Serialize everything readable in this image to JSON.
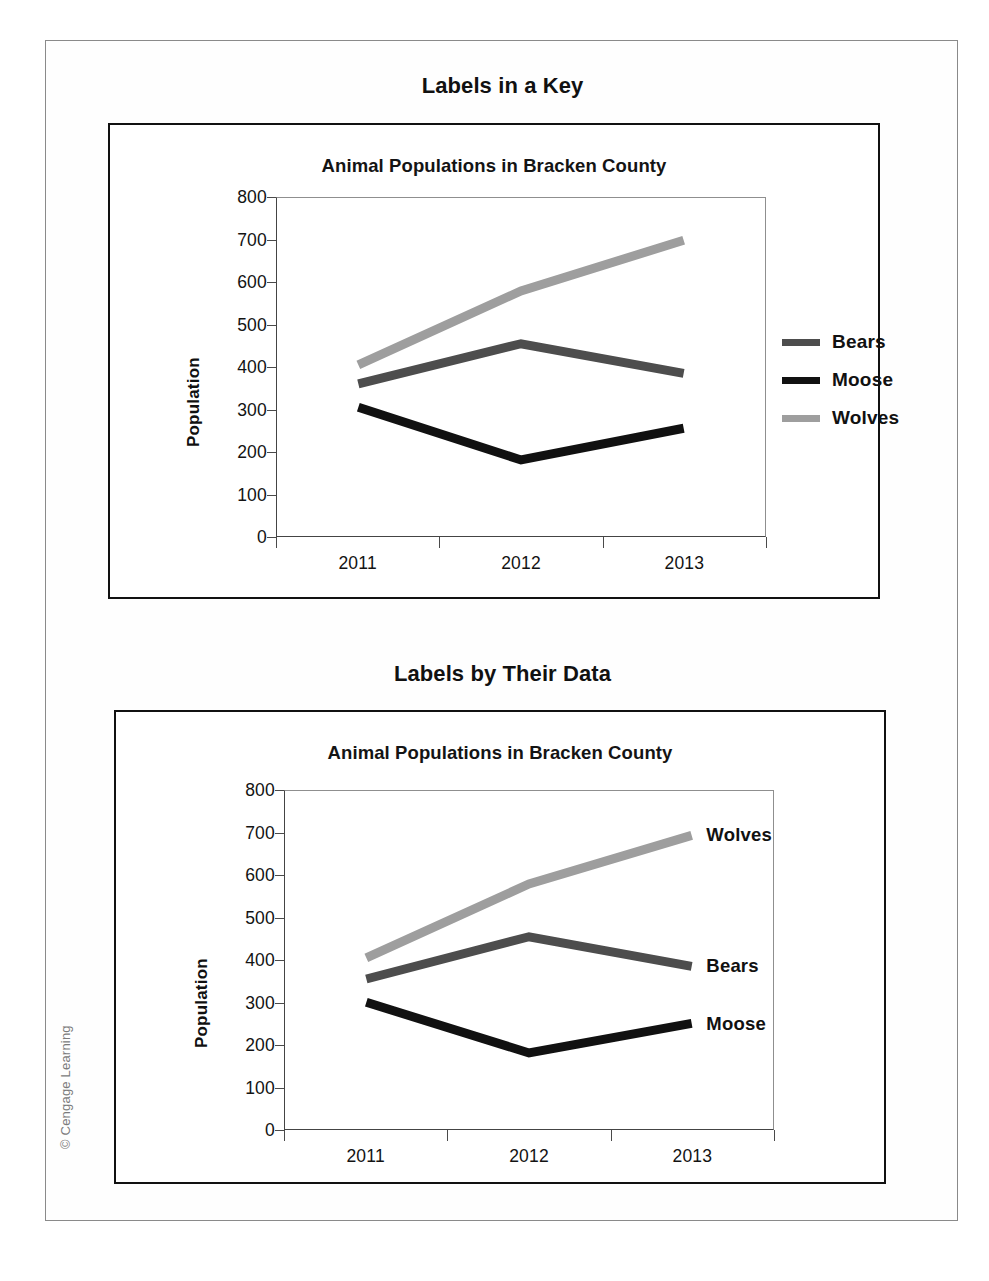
{
  "figure": {
    "copyright": "© Cengage Learning"
  },
  "sections": [
    {
      "heading": "Labels in a Key",
      "chart_title": "Animal Populations in Bracken County",
      "label_style": "key"
    },
    {
      "heading": "Labels by Their Data",
      "chart_title": "Animal Populations in Bracken County",
      "label_style": "inline"
    }
  ],
  "legend": {
    "items": [
      {
        "label": "Bears",
        "color": "#4d4d4d"
      },
      {
        "label": "Moose",
        "color": "#111111"
      },
      {
        "label": "Wolves",
        "color": "#9e9e9e"
      }
    ]
  },
  "chart_data": [
    {
      "type": "line",
      "title": "Animal Populations in Bracken County",
      "subtitle": "Labels in a Key",
      "xlabel": "",
      "ylabel": "Population",
      "categories": [
        "2011",
        "2012",
        "2013"
      ],
      "x": [
        2011,
        2012,
        2013
      ],
      "ylim": [
        0,
        800
      ],
      "yticks": [
        0,
        100,
        200,
        300,
        400,
        500,
        600,
        700,
        800
      ],
      "ytick_labels": [
        "0",
        "100",
        "200",
        "300",
        "400",
        "500",
        "600",
        "700",
        "800"
      ],
      "grid": false,
      "legend": "right",
      "legend_position": "right-outside",
      "series": [
        {
          "name": "Bears",
          "values": [
            360,
            455,
            385
          ],
          "color": "#4d4d4d"
        },
        {
          "name": "Moose",
          "values": [
            305,
            180,
            255
          ],
          "color": "#111111"
        },
        {
          "name": "Wolves",
          "values": [
            405,
            580,
            700
          ],
          "color": "#9e9e9e"
        }
      ]
    },
    {
      "type": "line",
      "title": "Animal Populations in Bracken County",
      "subtitle": "Labels by Their Data",
      "xlabel": "",
      "ylabel": "Population",
      "categories": [
        "2011",
        "2012",
        "2013"
      ],
      "x": [
        2011,
        2012,
        2013
      ],
      "ylim": [
        0,
        800
      ],
      "yticks": [
        0,
        100,
        200,
        300,
        400,
        500,
        600,
        700,
        800
      ],
      "ytick_labels": [
        "0",
        "100",
        "200",
        "300",
        "400",
        "500",
        "600",
        "700",
        "800"
      ],
      "grid": false,
      "legend": "none",
      "legend_position": "inline-end-of-line",
      "annotations": [
        {
          "text": "Wolves",
          "series": "Wolves",
          "at_x": "2013",
          "at_y": 700
        },
        {
          "text": "Bears",
          "series": "Bears",
          "at_x": "2013",
          "at_y": 385
        },
        {
          "text": "Moose",
          "series": "Moose",
          "at_x": "2013",
          "at_y": 255
        }
      ],
      "series": [
        {
          "name": "Bears",
          "values": [
            355,
            455,
            385
          ],
          "color": "#4d4d4d"
        },
        {
          "name": "Moose",
          "values": [
            300,
            180,
            250
          ],
          "color": "#111111"
        },
        {
          "name": "Wolves",
          "values": [
            405,
            580,
            695
          ],
          "color": "#9e9e9e"
        }
      ]
    }
  ]
}
